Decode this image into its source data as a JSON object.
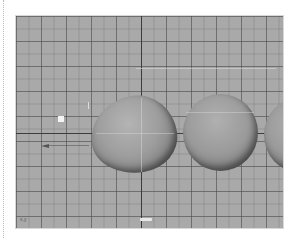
{
  "app": {
    "type": "3d-modeling-viewport",
    "view": "front orthographic"
  },
  "viewport": {
    "background_color": "#a9a9a9",
    "grid_line_color": "#505050",
    "axis_line_color": "#3c3c3c",
    "objects": [
      {
        "name": "egg-shape",
        "type": "deformed-sphere",
        "selected": false
      },
      {
        "name": "sphere-2",
        "type": "sphere",
        "selected": false
      },
      {
        "name": "sphere-3",
        "type": "sphere",
        "partially_visible": true
      }
    ],
    "gizmo_label": "x,y",
    "hud_label": "",
    "light_marker": "directional-light",
    "arrow": "left-arrow"
  },
  "caption": ""
}
